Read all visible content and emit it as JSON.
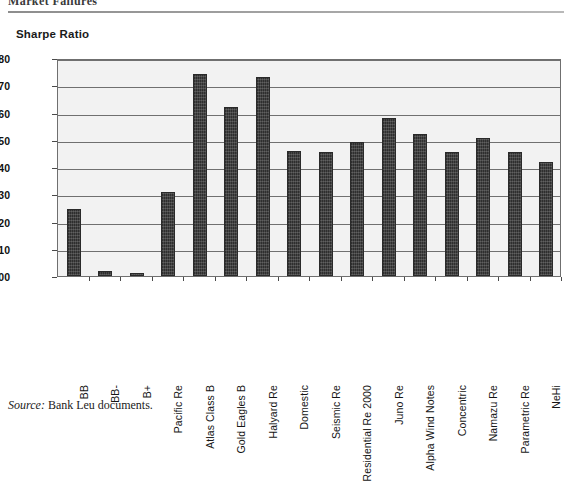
{
  "running_head": "Market Failures",
  "chart_title": "Sharpe Ratio",
  "source_note": {
    "label": "Source:",
    "text": "Bank Leu documents."
  },
  "colors": {
    "bar_fill": "#3b3b3b",
    "plot_background": "#f2f2f2",
    "gridline": "#707070",
    "axis": "#6f6f6f"
  },
  "chart_data": {
    "type": "bar",
    "title": "Sharpe Ratio",
    "xlabel": "",
    "ylabel": "Sharpe Ratio",
    "ylim": [
      0.0,
      0.8
    ],
    "ytick_step": 0.1,
    "yticks": [
      "0.00",
      "0.10",
      "0.20",
      "0.30",
      "0.40",
      "0.50",
      "0.60",
      "0.70",
      "0.80"
    ],
    "grid": true,
    "legend": false,
    "categories": [
      "BB",
      "BB-",
      "B+",
      "Pacific Re",
      "Atlas Class B",
      "Gold Eagles B",
      "Halyard Re",
      "Domestic",
      "Seismic Re",
      "Residential Re 2000",
      "Juno Re",
      "Alpha Wind Notes",
      "Concentric",
      "Namazu Re",
      "Parametric Re",
      "NeHi"
    ],
    "values": [
      0.245,
      0.02,
      0.01,
      0.31,
      0.74,
      0.62,
      0.73,
      0.46,
      0.455,
      0.49,
      0.58,
      0.52,
      0.455,
      0.505,
      0.455,
      0.42
    ]
  }
}
